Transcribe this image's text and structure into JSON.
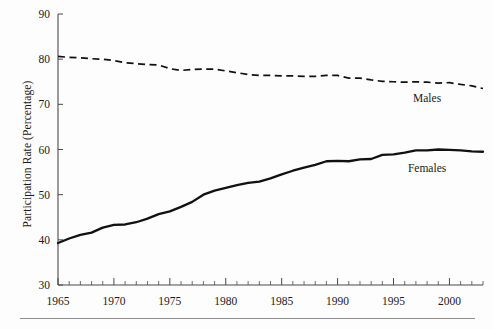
{
  "figure": {
    "background_color": "#fdfdfd",
    "ink_color": "#111111",
    "axis_color": "#4a4a4a",
    "rule_color": "#8d8d8d"
  },
  "axes": {
    "y_title": "Participation Rate (Percentage)",
    "y_ticks": [
      30,
      40,
      50,
      60,
      70,
      80,
      90
    ],
    "y_min": 30,
    "y_max": 90,
    "x_ticks_major": [
      1965,
      1970,
      1975,
      1980,
      1985,
      1990,
      1995,
      2000
    ],
    "x_min": 1965,
    "x_max": 2003,
    "x_title": ""
  },
  "annotations": {
    "males_label": "Males",
    "females_label": "Females"
  },
  "chart_data": {
    "type": "line",
    "title": "",
    "subtitle": "",
    "xlabel": "",
    "ylabel": "Participation Rate (Percentage)",
    "xlim": [
      1965,
      2003
    ],
    "ylim": [
      30,
      90
    ],
    "grid": false,
    "legend_position": "inline-annotation",
    "x": [
      1965,
      1966,
      1967,
      1968,
      1969,
      1970,
      1971,
      1972,
      1973,
      1974,
      1975,
      1976,
      1977,
      1978,
      1979,
      1980,
      1981,
      1982,
      1983,
      1984,
      1985,
      1986,
      1987,
      1988,
      1989,
      1990,
      1991,
      1992,
      1993,
      1994,
      1995,
      1996,
      1997,
      1998,
      1999,
      2000,
      2001,
      2002,
      2003
    ],
    "series": [
      {
        "name": "Males",
        "style": "dashed",
        "values": [
          80.6,
          80.4,
          80.3,
          80.1,
          80.0,
          79.7,
          79.2,
          79.0,
          78.8,
          78.7,
          77.9,
          77.5,
          77.7,
          77.8,
          77.8,
          77.4,
          77.0,
          76.6,
          76.4,
          76.4,
          76.3,
          76.3,
          76.2,
          76.2,
          76.4,
          76.4,
          75.8,
          75.8,
          75.4,
          75.1,
          75.0,
          74.9,
          75.0,
          74.9,
          74.7,
          74.8,
          74.4,
          74.1,
          73.5
        ]
      },
      {
        "name": "Females",
        "style": "solid",
        "values": [
          39.3,
          40.3,
          41.1,
          41.6,
          42.7,
          43.3,
          43.4,
          43.9,
          44.7,
          45.7,
          46.3,
          47.3,
          48.4,
          50.0,
          50.9,
          51.5,
          52.1,
          52.6,
          52.9,
          53.6,
          54.5,
          55.3,
          56.0,
          56.6,
          57.4,
          57.5,
          57.4,
          57.8,
          57.9,
          58.8,
          58.9,
          59.3,
          59.8,
          59.8,
          60.0,
          59.9,
          59.8,
          59.6,
          59.5
        ]
      }
    ],
    "annotations": [
      {
        "text": "Males",
        "x": 1998,
        "y": 70.5
      },
      {
        "text": "Females",
        "x": 1998,
        "y": 55.0
      }
    ]
  }
}
